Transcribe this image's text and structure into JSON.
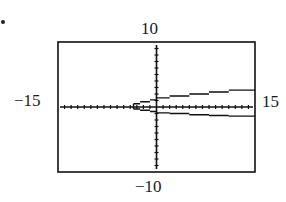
{
  "chart_data": {
    "type": "line",
    "title": "",
    "xlabel": "",
    "ylabel": "",
    "xlim": [
      -15,
      15
    ],
    "ylim": [
      -10,
      10
    ],
    "xscale_ticks": 1,
    "yscale_ticks": 1,
    "grid": false,
    "legend": null,
    "window_labels": {
      "ymax": "10",
      "ymin": "-10",
      "xmin": "-15",
      "xmax": "15"
    },
    "series": [
      {
        "name": "upper branch",
        "x": [
          -3.5,
          -2.5,
          -1,
          0,
          2,
          5,
          8,
          11,
          15
        ],
        "y": [
          0.5,
          0.8,
          1.1,
          1.4,
          1.7,
          2.0,
          2.3,
          2.6,
          2.9
        ]
      },
      {
        "name": "lower branch",
        "x": [
          -3.5,
          -2.5,
          -1,
          0,
          2,
          5,
          8,
          11,
          15
        ],
        "y": [
          -0.3,
          -0.5,
          -0.7,
          -0.9,
          -1.0,
          -1.2,
          -1.3,
          -1.4,
          -1.5
        ]
      }
    ]
  },
  "labels": {
    "top": "10",
    "bottom": "−10",
    "left": "−15",
    "right": "15"
  }
}
